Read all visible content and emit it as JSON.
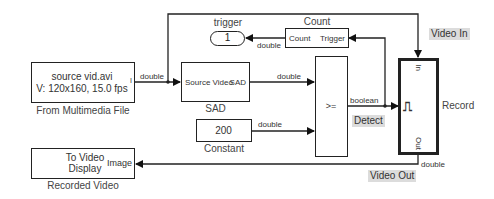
{
  "diagram": {
    "blocks": {
      "multimedia_file": {
        "line1": "source vid.avi",
        "line2": "V: 120x160, 15.0 fps",
        "port_mark": "I",
        "name": "From Multimedia File"
      },
      "sad": {
        "input_port": "Source Video",
        "output_port": "SAD",
        "name": "SAD"
      },
      "constant": {
        "value": "200",
        "name": "Constant"
      },
      "comparator": {
        "operator": ">="
      },
      "count": {
        "title": "Count",
        "output_port": "Count",
        "input_port": "Trigger"
      },
      "trigger_goto": {
        "label": "trigger",
        "value": "1"
      },
      "record": {
        "name": "Record",
        "in_port": "In",
        "out_port": "Out",
        "trigger_symbol": "⎍"
      },
      "video_display": {
        "line1": "To Video",
        "line2": "Display",
        "port": "Image",
        "name": "Recorded Video"
      }
    },
    "signals": {
      "file_to_sad": "double",
      "sad_to_compare": "double",
      "const_to_compare": "double",
      "compare_out": "boolean",
      "count_to_trigger": "double",
      "record_out": "double"
    },
    "annotations": {
      "video_in": "Video In",
      "detect": "Detect",
      "video_out": "Video Out"
    }
  }
}
